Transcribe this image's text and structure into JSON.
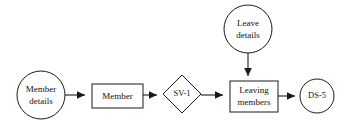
{
  "diagram": {
    "type": "data-flow-diagram",
    "background_color": "#ffffff",
    "line_color": "#1a1a1a",
    "text_color": "#111111",
    "nodes": [
      {
        "id": "member-details",
        "shape": "circle",
        "label_line1": "Member",
        "label_line2": "details",
        "cx": 41,
        "cy": 95,
        "r": 24
      },
      {
        "id": "member",
        "shape": "rectangle",
        "label_line1": "Member",
        "label_line2": "",
        "x": 92,
        "y": 84,
        "width": 51,
        "height": 24
      },
      {
        "id": "sv-1",
        "shape": "diamond",
        "label_line1": "SV-1",
        "label_line2": "",
        "cx": 182,
        "cy": 94,
        "half_width": 19,
        "half_height": 19
      },
      {
        "id": "leave-details",
        "shape": "circle",
        "label_line1": "Leave",
        "label_line2": "details",
        "cx": 248,
        "cy": 29,
        "r": 24
      },
      {
        "id": "leaving-members",
        "shape": "rectangle",
        "label_line1": "Leaving",
        "label_line2": "members",
        "x": 230,
        "y": 81,
        "width": 48,
        "height": 31
      },
      {
        "id": "ds-5",
        "shape": "circle",
        "label_line1": "DS-5",
        "label_line2": "",
        "cx": 317,
        "cy": 96,
        "r": 17
      }
    ],
    "edges": [
      {
        "id": "edge-member-details-to-member",
        "from": "member-details",
        "to": "member",
        "direction": "right"
      },
      {
        "id": "edge-member-to-sv-1",
        "from": "member",
        "to": "sv-1",
        "direction": "right"
      },
      {
        "id": "edge-sv-1-to-leaving-members",
        "from": "sv-1",
        "to": "leaving-members",
        "direction": "right"
      },
      {
        "id": "edge-leave-details-to-leaving-members",
        "from": "leave-details",
        "to": "leaving-members",
        "direction": "down"
      },
      {
        "id": "edge-leaving-members-to-ds-5",
        "from": "leaving-members",
        "to": "ds-5",
        "direction": "right"
      }
    ]
  }
}
